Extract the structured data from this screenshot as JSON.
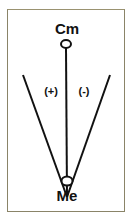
{
  "diagram": {
    "top_node": {
      "label": "Cm"
    },
    "bottom_node": {
      "label": "Me"
    },
    "left_angle": {
      "label": "(+)"
    },
    "right_angle": {
      "label": "(-)"
    },
    "colors": {
      "line": "#111111",
      "frame": "#8a8468",
      "background": "#ffffff"
    }
  }
}
